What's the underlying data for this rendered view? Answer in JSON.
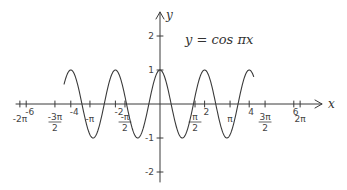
{
  "chart_data": {
    "type": "line",
    "title": "y = cos πx",
    "function": "cos(pi*x)",
    "xlabel": "x",
    "ylabel": "y",
    "xlim": [
      -7,
      7.5
    ],
    "ylim": [
      -2.2,
      2.4
    ],
    "domain_drawn": [
      -4.3,
      4.2
    ],
    "grid": false,
    "x_ticks_top": [
      {
        "value": -6,
        "label": "-6"
      },
      {
        "value": -4,
        "label": "-4"
      },
      {
        "value": -2,
        "label": "-2"
      },
      {
        "value": 2,
        "label": "2"
      },
      {
        "value": 4,
        "label": "4"
      },
      {
        "value": 6,
        "label": "6"
      }
    ],
    "x_ticks_bottom": [
      {
        "value": -6.283,
        "label": "-2π"
      },
      {
        "value": -4.712,
        "label": "-3π/2"
      },
      {
        "value": -3.1416,
        "label": "-π"
      },
      {
        "value": -1.5708,
        "label": "-π/2"
      },
      {
        "value": 1.5708,
        "label": "π/2"
      },
      {
        "value": 3.1416,
        "label": "π"
      },
      {
        "value": 4.712,
        "label": "3π/2"
      },
      {
        "value": 6.283,
        "label": "2π"
      }
    ],
    "y_ticks": [
      {
        "value": 2,
        "label": "2"
      },
      {
        "value": 1,
        "label": "1"
      },
      {
        "value": -1,
        "label": "-1"
      },
      {
        "value": -2,
        "label": "-2"
      }
    ]
  }
}
